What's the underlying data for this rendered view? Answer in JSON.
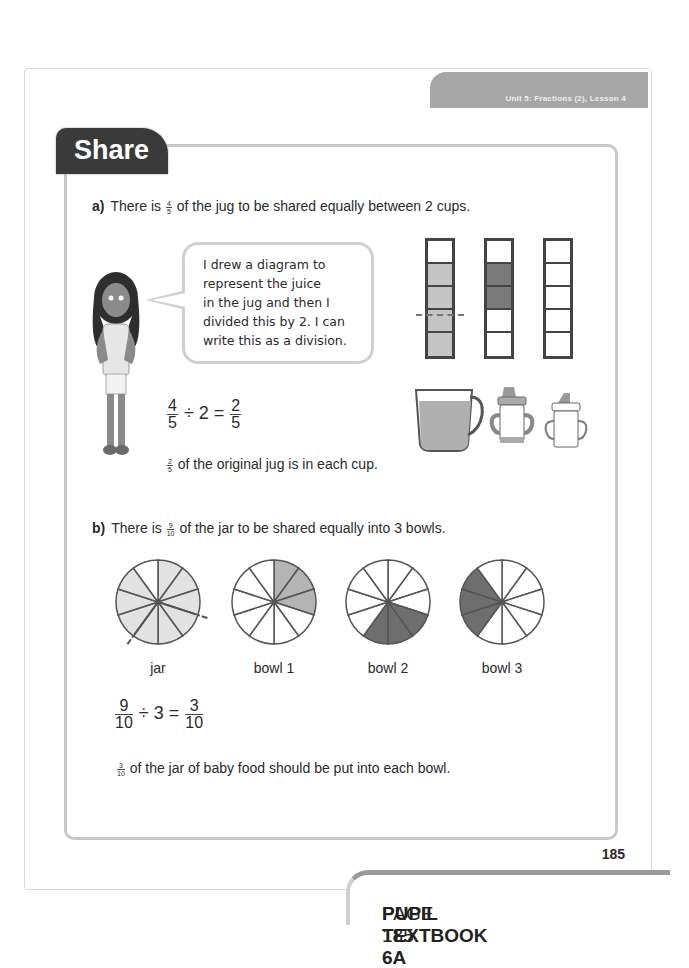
{
  "header": {
    "unit_lesson": "Unit 5: Fractions (2), Lesson 4"
  },
  "section": {
    "title": "Share"
  },
  "part_a": {
    "label": "a)",
    "question_pre": "There is",
    "question_frac": {
      "n": "4",
      "d": "5"
    },
    "question_post": "of the jug to be shared equally between 2 cups.",
    "speech": [
      "I drew a diagram to",
      "represent the juice",
      "in the jug and then I",
      "divided this by 2. I can",
      "write this as a division."
    ],
    "equation": {
      "a_n": "4",
      "a_d": "5",
      "op": "÷ 2 =",
      "r_n": "2",
      "r_d": "5"
    },
    "answer_frac": {
      "n": "2",
      "d": "5"
    },
    "answer_text": "of the original jug is in each cup.",
    "bars": [
      {
        "name": "jug",
        "cells": [
          "empty",
          "light",
          "light",
          "light",
          "light"
        ]
      },
      {
        "name": "cup1",
        "cells": [
          "empty",
          "dark",
          "dark",
          "empty",
          "empty"
        ]
      },
      {
        "name": "cup2",
        "cells": [
          "empty",
          "empty",
          "empty",
          "empty",
          "empty"
        ]
      }
    ],
    "containers": [
      "jug",
      "cup-1",
      "cup-2"
    ]
  },
  "part_b": {
    "label": "b)",
    "question_pre": "There is",
    "question_frac": {
      "n": "9",
      "d": "10"
    },
    "question_post": "of the jar to be shared equally into 3 bowls.",
    "pies": [
      {
        "label": "jar",
        "filled": [
          0,
          1,
          2,
          3,
          4,
          5,
          6,
          7,
          8
        ],
        "shade": "#e2e2e2"
      },
      {
        "label": "bowl 1",
        "filled": [
          0,
          1,
          2
        ],
        "shade": "#b4b4b4"
      },
      {
        "label": "bowl 2",
        "filled": [
          3,
          4,
          5
        ],
        "shade": "#6e6e6e"
      },
      {
        "label": "bowl 3",
        "filled": [
          6,
          7,
          8
        ],
        "shade": "#6e6e6e"
      }
    ],
    "equation": {
      "a_n": "9",
      "a_d": "10",
      "op": "÷ 3 =",
      "r_n": "3",
      "r_d": "10"
    },
    "answer_frac": {
      "n": "3",
      "d": "10"
    },
    "answer_text": "of the jar of baby food should be put into each bowl."
  },
  "page_number": "185",
  "footer": {
    "book": "PUPIL TEXTBOOK 6A",
    "page": "PAGE 185"
  },
  "colors": {
    "tab_dark": "#3a3a3a",
    "unit_tab": "#a6a6a6",
    "frame": "#c8c8c8"
  }
}
